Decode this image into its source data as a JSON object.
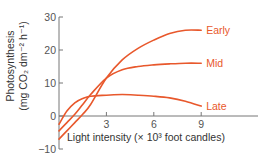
{
  "chart_data": {
    "type": "line",
    "title": "",
    "xlabel": "Light intensity (× 10³ foot candles)",
    "ylabel_line1": "Photosynthesis",
    "ylabel_line2": "(mg CO₂ dm⁻² h⁻¹)",
    "xlim": [
      0,
      12
    ],
    "ylim": [
      -10,
      30
    ],
    "xticks": [
      3,
      6,
      9
    ],
    "xtick_labels": [
      "3",
      "6",
      "9"
    ],
    "yticks": [
      -10,
      0,
      10,
      20,
      30
    ],
    "ytick_labels": [
      "−10",
      "0",
      "10",
      "20",
      "30"
    ],
    "grid": false,
    "legend": "inline-right",
    "line_color": "#e8582c",
    "label_color": "#e8582c",
    "series": [
      {
        "name": "Early",
        "x": [
          0,
          0.5,
          1,
          1.5,
          2,
          3,
          4,
          5,
          6,
          7,
          8,
          9
        ],
        "y": [
          -7,
          -4.5,
          -2,
          0.5,
          3.5,
          11.5,
          17,
          20.5,
          23,
          25,
          26,
          26
        ]
      },
      {
        "name": "Mid",
        "x": [
          0,
          0.5,
          1,
          1.5,
          2,
          3,
          4,
          5,
          6,
          7,
          8,
          9
        ],
        "y": [
          -4.5,
          -2,
          0.5,
          3.5,
          6.5,
          11.5,
          14,
          15,
          15.5,
          15.8,
          16,
          16
        ]
      },
      {
        "name": "Late",
        "x": [
          0,
          0.5,
          1,
          1.5,
          2,
          3,
          4,
          5,
          6,
          7,
          8,
          9
        ],
        "y": [
          -2.5,
          1.5,
          4,
          5.3,
          6,
          6.3,
          6.5,
          6.3,
          6,
          5.5,
          4.5,
          3
        ]
      }
    ]
  }
}
